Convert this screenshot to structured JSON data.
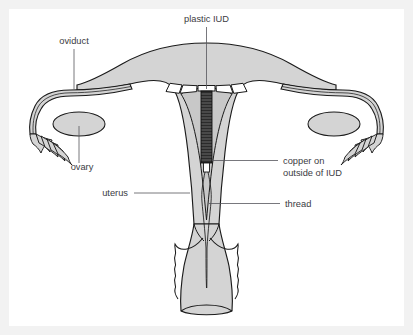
{
  "diagram": {
    "type": "anatomical-cross-section",
    "background_color": "#ffffff",
    "panel_color": "#ffffff",
    "page_margin_color": "#f2f2f2",
    "tissue_fill": "#d4d4d4",
    "cavity_fill": "#c8c8c8",
    "outline_color": "#1a1a1a",
    "label_color": "#3b3b42",
    "iud_plastic_color": "#ffffff",
    "iud_copper_color": "#2b2b2b"
  },
  "labels": {
    "plastic_iud": "plastic IUD",
    "oviduct": "oviduct",
    "ovary": "ovary",
    "uterus": "uterus",
    "thread": "thread",
    "copper_line1": "copper on",
    "copper_line2": "outside of IUD"
  },
  "structures": [
    {
      "name": "oviduct",
      "label": "oviduct",
      "side": "both"
    },
    {
      "name": "ovary",
      "label": "ovary",
      "side": "both"
    },
    {
      "name": "uterus",
      "label": "uterus",
      "side": "center"
    },
    {
      "name": "cervix",
      "label": "",
      "side": "center"
    },
    {
      "name": "fimbriae",
      "label": "",
      "side": "both"
    },
    {
      "name": "plastic-iud",
      "label": "plastic IUD",
      "side": "center"
    },
    {
      "name": "copper-coil",
      "label": "copper on outside of IUD",
      "side": "center"
    },
    {
      "name": "thread",
      "label": "thread",
      "side": "center"
    }
  ]
}
